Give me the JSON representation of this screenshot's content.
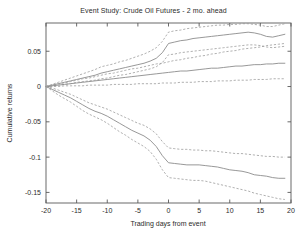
{
  "chart_data": {
    "type": "line",
    "title": "Event Study: Crude Oil Futures - 2 mo. ahead",
    "xlabel": "Trading days from event",
    "ylabel": "Cumulative returns",
    "xlim": [
      -20,
      20
    ],
    "ylim": [
      -0.165,
      0.09
    ],
    "grid": false,
    "legend": null,
    "xticks": [
      -20,
      -15,
      -10,
      -5,
      0,
      5,
      10,
      15,
      20
    ],
    "xticklabels": [
      "-20",
      "-15",
      "-10",
      "-5",
      "0",
      "5",
      "10",
      "15",
      "20"
    ],
    "yticks": [
      0.05,
      0,
      -0.05,
      -0.1,
      -0.15
    ],
    "yticklabels": [
      "0.05",
      "0",
      "-0.05",
      "-0.1",
      "-0.15"
    ],
    "x": [
      -20,
      -19,
      -18,
      -17,
      -16,
      -15,
      -14,
      -13,
      -12,
      -11,
      -10,
      -9,
      -8,
      -7,
      -6,
      -5,
      -4,
      -3,
      -2,
      -1,
      0,
      1,
      2,
      3,
      4,
      5,
      6,
      7,
      8,
      9,
      10,
      11,
      12,
      13,
      14,
      15,
      16,
      17,
      18,
      19
    ],
    "series": [
      {
        "name": "Positive event mean",
        "style": "solid",
        "values": [
          0.0,
          0.002,
          0.004,
          0.006,
          0.008,
          0.01,
          0.012,
          0.014,
          0.016,
          0.019,
          0.021,
          0.023,
          0.025,
          0.027,
          0.029,
          0.031,
          0.033,
          0.036,
          0.04,
          0.048,
          0.061,
          0.063,
          0.065,
          0.066,
          0.068,
          0.069,
          0.07,
          0.071,
          0.072,
          0.073,
          0.074,
          0.075,
          0.076,
          0.077,
          0.076,
          0.074,
          0.071,
          0.07,
          0.072,
          0.074
        ]
      },
      {
        "name": "Positive event upper band",
        "style": "dashed",
        "values": [
          0.0,
          0.003,
          0.006,
          0.009,
          0.012,
          0.015,
          0.018,
          0.021,
          0.024,
          0.028,
          0.03,
          0.032,
          0.035,
          0.037,
          0.04,
          0.043,
          0.046,
          0.05,
          0.055,
          0.064,
          0.077,
          0.079,
          0.08,
          0.082,
          0.083,
          0.084,
          0.085,
          0.086,
          0.087,
          0.087,
          0.088,
          0.088,
          0.089,
          0.089,
          0.088,
          0.087,
          0.085,
          0.085,
          0.087,
          0.089
        ]
      },
      {
        "name": "Positive event lower band",
        "style": "dashed",
        "values": [
          0.0,
          0.001,
          0.002,
          0.003,
          0.004,
          0.006,
          0.007,
          0.008,
          0.009,
          0.011,
          0.012,
          0.014,
          0.016,
          0.017,
          0.019,
          0.021,
          0.023,
          0.025,
          0.028,
          0.034,
          0.045,
          0.046,
          0.048,
          0.049,
          0.05,
          0.051,
          0.052,
          0.053,
          0.054,
          0.055,
          0.056,
          0.057,
          0.058,
          0.059,
          0.059,
          0.058,
          0.056,
          0.055,
          0.056,
          0.057
        ]
      },
      {
        "name": "No-event mean",
        "style": "solid",
        "values": [
          0.0,
          0.001,
          0.002,
          0.003,
          0.004,
          0.005,
          0.006,
          0.007,
          0.008,
          0.009,
          0.01,
          0.011,
          0.012,
          0.013,
          0.014,
          0.015,
          0.016,
          0.017,
          0.018,
          0.019,
          0.02,
          0.021,
          0.022,
          0.022,
          0.023,
          0.024,
          0.025,
          0.026,
          0.026,
          0.027,
          0.028,
          0.029,
          0.029,
          0.03,
          0.031,
          0.031,
          0.032,
          0.032,
          0.033,
          0.033
        ]
      },
      {
        "name": "No-event upper band",
        "style": "dashed",
        "values": [
          0.0,
          0.002,
          0.004,
          0.005,
          0.007,
          0.009,
          0.011,
          0.012,
          0.014,
          0.016,
          0.018,
          0.019,
          0.021,
          0.023,
          0.025,
          0.026,
          0.028,
          0.03,
          0.032,
          0.033,
          0.035,
          0.037,
          0.038,
          0.04,
          0.041,
          0.043,
          0.044,
          0.046,
          0.047,
          0.049,
          0.05,
          0.051,
          0.053,
          0.054,
          0.055,
          0.056,
          0.058,
          0.059,
          0.06,
          0.061
        ]
      },
      {
        "name": "No-event lower band",
        "style": "dashed",
        "values": [
          0.0,
          0.0,
          0.0,
          0.001,
          0.001,
          0.001,
          0.001,
          0.002,
          0.002,
          0.002,
          0.002,
          0.003,
          0.003,
          0.003,
          0.003,
          0.004,
          0.004,
          0.004,
          0.004,
          0.005,
          0.005,
          0.005,
          0.006,
          0.006,
          0.006,
          0.007,
          0.007,
          0.007,
          0.008,
          0.008,
          0.008,
          0.009,
          0.009,
          0.009,
          0.01,
          0.01,
          0.01,
          0.011,
          0.011,
          0.011
        ]
      },
      {
        "name": "Negative event mean",
        "style": "solid",
        "values": [
          0.0,
          -0.004,
          -0.008,
          -0.012,
          -0.016,
          -0.021,
          -0.026,
          -0.031,
          -0.035,
          -0.038,
          -0.042,
          -0.047,
          -0.052,
          -0.057,
          -0.062,
          -0.066,
          -0.07,
          -0.076,
          -0.085,
          -0.098,
          -0.108,
          -0.109,
          -0.11,
          -0.111,
          -0.111,
          -0.111,
          -0.112,
          -0.113,
          -0.114,
          -0.116,
          -0.118,
          -0.119,
          -0.12,
          -0.122,
          -0.125,
          -0.126,
          -0.127,
          -0.129,
          -0.13,
          -0.13
        ]
      },
      {
        "name": "Negative event upper band",
        "style": "dashed",
        "values": [
          0.0,
          -0.002,
          -0.005,
          -0.008,
          -0.011,
          -0.015,
          -0.019,
          -0.023,
          -0.026,
          -0.029,
          -0.032,
          -0.036,
          -0.04,
          -0.044,
          -0.048,
          -0.052,
          -0.055,
          -0.06,
          -0.067,
          -0.078,
          -0.087,
          -0.088,
          -0.089,
          -0.089,
          -0.09,
          -0.09,
          -0.091,
          -0.091,
          -0.092,
          -0.093,
          -0.094,
          -0.095,
          -0.095,
          -0.096,
          -0.097,
          -0.098,
          -0.099,
          -0.099,
          -0.1,
          -0.1
        ]
      },
      {
        "name": "Negative event lower band",
        "style": "dashed",
        "values": [
          0.0,
          -0.006,
          -0.012,
          -0.017,
          -0.022,
          -0.028,
          -0.034,
          -0.039,
          -0.043,
          -0.047,
          -0.052,
          -0.058,
          -0.064,
          -0.069,
          -0.075,
          -0.08,
          -0.085,
          -0.092,
          -0.103,
          -0.118,
          -0.129,
          -0.13,
          -0.131,
          -0.132,
          -0.133,
          -0.133,
          -0.134,
          -0.136,
          -0.138,
          -0.14,
          -0.142,
          -0.144,
          -0.146,
          -0.148,
          -0.151,
          -0.153,
          -0.155,
          -0.157,
          -0.159,
          -0.16
        ]
      }
    ]
  },
  "colors": {
    "axis": "#5a5a5a",
    "text": "#2b2b2b",
    "solid_line": "#8c8c8c",
    "dashed_line": "#9c9c9c",
    "background": "#ffffff"
  }
}
